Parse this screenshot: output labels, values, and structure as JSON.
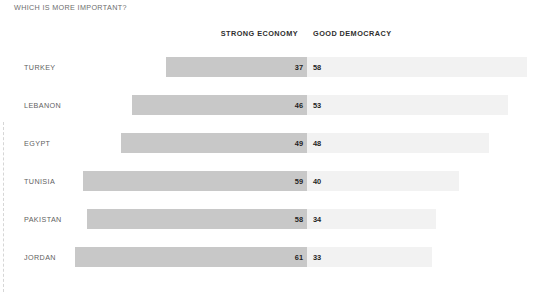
{
  "chart_data": {
    "type": "bar",
    "subtype": "diverging-horizontal-bar",
    "title": "WHICH IS MORE IMPORTANT?",
    "xlabel": "",
    "ylabel": "",
    "grid": false,
    "legend_position": "top",
    "categories": [
      "TURKEY",
      "LEBANON",
      "EGYPT",
      "TUNISIA",
      "PAKISTAN",
      "JORDAN"
    ],
    "series": [
      {
        "name": "STRONG ECONOMY",
        "side": "left",
        "color": "#c8c8c8",
        "values": [
          37,
          46,
          49,
          59,
          58,
          61
        ]
      },
      {
        "name": "GOOD DEMOCRACY",
        "side": "right",
        "color": "#f2f2f2",
        "values": [
          58,
          53,
          48,
          40,
          34,
          33
        ]
      }
    ]
  },
  "headers": {
    "strong_economy": "STRONG ECONOMY",
    "good_democracy": "GOOD DEMOCRACY"
  },
  "rows": [
    {
      "label": "TURKEY",
      "economy": 37,
      "democracy": 58
    },
    {
      "label": "LEBANON",
      "economy": 46,
      "democracy": 53
    },
    {
      "label": "EGYPT",
      "economy": 49,
      "democracy": 48
    },
    {
      "label": "TUNISIA",
      "economy": 59,
      "democracy": 40
    },
    {
      "label": "PAKISTAN",
      "economy": 58,
      "democracy": 34
    },
    {
      "label": "JORDAN",
      "economy": 61,
      "democracy": 33
    }
  ],
  "layout": {
    "axis_x": 307,
    "px_per_unit": 3.8,
    "first_row_top": 52,
    "row_pitch": 38,
    "row_height": 30
  }
}
